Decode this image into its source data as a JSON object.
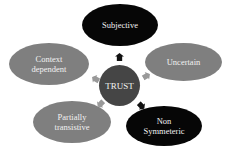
{
  "diagram": {
    "center": {
      "label": "TRUST",
      "color": "#454545"
    },
    "nodes": [
      {
        "id": "subjective",
        "label": "Subjective",
        "color": "#060606"
      },
      {
        "id": "uncertain",
        "label": "Uncertain",
        "color": "#7f7f7f"
      },
      {
        "id": "context",
        "label": "Context dependent",
        "color": "#7f7f7f"
      },
      {
        "id": "partial",
        "label": "Partially transistive",
        "color": "#7f7f7f"
      },
      {
        "id": "nonsym",
        "label": "Non Symmeteric",
        "color": "#060606"
      }
    ]
  }
}
